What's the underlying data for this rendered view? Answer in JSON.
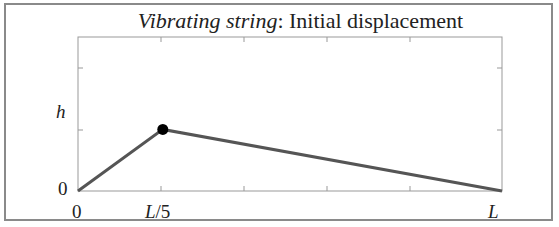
{
  "chart_data": {
    "type": "line",
    "title_italic": "Vibrating string",
    "title_rest": ": Initial displacement",
    "xlabel": "",
    "ylabel": "",
    "x_ticks": [
      "0",
      "L/5",
      "L"
    ],
    "y_ticks": [
      "0",
      "h"
    ],
    "x": [
      0,
      0.2,
      1.0
    ],
    "y": [
      0,
      1,
      0
    ],
    "marker_point": {
      "x": 0.2,
      "y": 1
    },
    "xlim": [
      0,
      1
    ],
    "ylim": [
      0,
      2.5
    ],
    "grid": false,
    "line_color": "#555555",
    "marker_color": "#000000"
  },
  "labels": {
    "x0": "0",
    "xL5_L": "L",
    "xL5_rest": "/5",
    "xL": "L",
    "y0": "0",
    "yh": "h"
  }
}
